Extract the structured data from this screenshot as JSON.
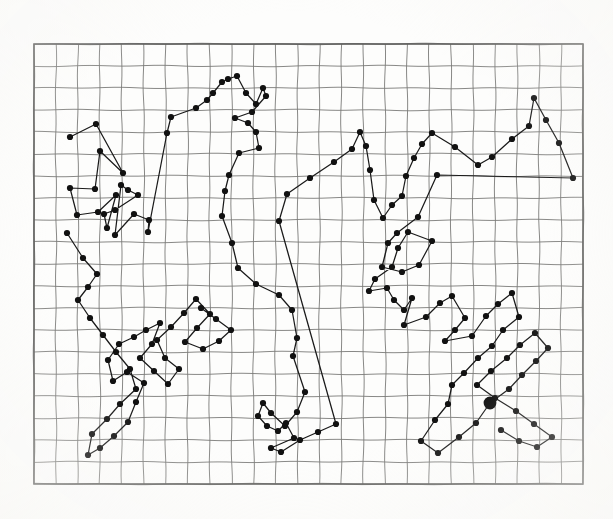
{
  "figure": {
    "kind": "scatter-path-plot-on-graph-paper",
    "image_size": {
      "width": 613,
      "height": 519
    },
    "background_color": "#fdfdfc",
    "grid": {
      "visible": true,
      "x0": 34,
      "y0": 44,
      "x1": 583,
      "y1": 484,
      "columns": 25,
      "rows": 20,
      "cell_width": 21.96,
      "cell_height": 22.0,
      "line_color": "#7a7a78",
      "line_width": 0.9,
      "border_color": "#5d5d5b",
      "border_width": 1.6
    },
    "path": {
      "stroke_color": "#1a1a1a",
      "stroke_width": 1.25,
      "marker_shape": "filled-circle",
      "marker_color": "#111111",
      "marker_radius": 3.1
    },
    "highlight_marker": {
      "label": "depot",
      "x": 490,
      "y": 403,
      "radius": 6.4,
      "color": "#0d0d0d"
    }
  },
  "chart_data": {
    "type": "scatter",
    "title": "",
    "subtitle": "",
    "xlabel": "",
    "ylabel": "",
    "xlim": [
      34,
      583
    ],
    "ylim": [
      44,
      484
    ],
    "grid": true,
    "legend": "none",
    "annotations": [],
    "series": [
      {
        "name": "tour",
        "kind": "path",
        "closed": false,
        "points": [
          [
            70,
            137
          ],
          [
            96,
            124
          ],
          [
            123,
            173
          ],
          [
            100,
            151
          ],
          [
            95,
            189
          ],
          [
            70,
            188
          ],
          [
            77,
            215
          ],
          [
            98,
            212
          ],
          [
            116,
            195
          ],
          [
            107,
            228
          ],
          [
            104,
            214
          ],
          [
            115,
            210
          ],
          [
            138,
            195
          ],
          [
            128,
            190
          ],
          [
            121,
            185
          ],
          [
            115,
            235
          ],
          [
            134,
            214
          ],
          [
            149,
            220
          ],
          [
            148,
            232
          ],
          [
            167,
            133
          ],
          [
            171,
            117
          ],
          [
            196,
            108
          ],
          [
            207,
            100
          ],
          [
            213,
            93
          ],
          [
            222,
            82
          ],
          [
            228,
            79
          ],
          [
            237,
            76
          ],
          [
            246,
            93
          ],
          [
            256,
            104
          ],
          [
            263,
            88
          ],
          [
            266,
            96
          ],
          [
            252,
            112
          ],
          [
            235,
            118
          ],
          [
            248,
            123
          ],
          [
            256,
            132
          ],
          [
            259,
            148
          ],
          [
            239,
            153
          ],
          [
            229,
            175
          ],
          [
            225,
            191
          ],
          [
            222,
            216
          ],
          [
            232,
            243
          ],
          [
            238,
            268
          ],
          [
            256,
            284
          ],
          [
            279,
            295
          ],
          [
            292,
            310
          ],
          [
            297,
            338
          ],
          [
            293,
            356
          ],
          [
            305,
            392
          ],
          [
            297,
            412
          ],
          [
            285,
            426
          ],
          [
            271,
            413
          ],
          [
            263,
            403
          ],
          [
            258,
            416
          ],
          [
            267,
            426
          ],
          [
            278,
            431
          ],
          [
            286,
            423
          ],
          [
            294,
            438
          ],
          [
            271,
            448
          ],
          [
            281,
            452
          ],
          [
            300,
            440
          ],
          [
            318,
            432
          ],
          [
            336,
            424
          ],
          [
            279,
            221
          ],
          [
            287,
            194
          ],
          [
            310,
            178
          ],
          [
            334,
            162
          ],
          [
            352,
            149
          ],
          [
            360,
            132
          ],
          [
            366,
            146
          ],
          [
            370,
            170
          ],
          [
            374,
            200
          ],
          [
            383,
            218
          ],
          [
            392,
            205
          ],
          [
            402,
            196
          ],
          [
            406,
            176
          ],
          [
            414,
            158
          ],
          [
            422,
            144
          ],
          [
            432,
            133
          ],
          [
            455,
            147
          ],
          [
            478,
            165
          ],
          [
            492,
            157
          ],
          [
            512,
            139
          ],
          [
            529,
            126
          ],
          [
            534,
            98
          ],
          [
            546,
            120
          ],
          [
            559,
            143
          ],
          [
            573,
            178
          ],
          [
            437,
            175
          ],
          [
            418,
            217
          ],
          [
            397,
            233
          ],
          [
            388,
            243
          ],
          [
            382,
            267
          ],
          [
            402,
            272
          ],
          [
            419,
            265
          ],
          [
            432,
            241
          ],
          [
            408,
            232
          ],
          [
            398,
            248
          ],
          [
            392,
            267
          ],
          [
            375,
            279
          ],
          [
            369,
            291
          ],
          [
            387,
            288
          ],
          [
            394,
            300
          ],
          [
            404,
            310
          ],
          [
            412,
            298
          ],
          [
            404,
            325
          ],
          [
            426,
            317
          ],
          [
            440,
            303
          ],
          [
            452,
            296
          ],
          [
            465,
            318
          ],
          [
            455,
            330
          ],
          [
            445,
            341
          ],
          [
            472,
            336
          ],
          [
            486,
            316
          ],
          [
            498,
            304
          ],
          [
            512,
            293
          ],
          [
            519,
            317
          ],
          [
            503,
            330
          ],
          [
            492,
            346
          ],
          [
            478,
            358
          ],
          [
            464,
            373
          ],
          [
            452,
            385
          ],
          [
            448,
            404
          ],
          [
            435,
            420
          ],
          [
            421,
            441
          ],
          [
            438,
            453
          ],
          [
            459,
            437
          ],
          [
            476,
            423
          ],
          [
            490,
            403
          ],
          [
            509,
            389
          ],
          [
            522,
            375
          ],
          [
            536,
            361
          ],
          [
            548,
            348
          ],
          [
            535,
            333
          ],
          [
            520,
            345
          ],
          [
            507,
            358
          ],
          [
            491,
            371
          ],
          [
            477,
            385
          ],
          [
            495,
            398
          ],
          [
            516,
            411
          ],
          [
            534,
            424
          ],
          [
            552,
            437
          ],
          [
            537,
            447
          ],
          [
            519,
            441
          ],
          [
            501,
            430
          ]
        ]
      },
      {
        "name": "cluster-upper-left-detail",
        "kind": "path",
        "closed": false,
        "points": [
          [
            67,
            233
          ],
          [
            83,
            258
          ],
          [
            97,
            274
          ],
          [
            88,
            287
          ],
          [
            78,
            300
          ],
          [
            90,
            318
          ],
          [
            103,
            335
          ],
          [
            116,
            352
          ],
          [
            130,
            369
          ],
          [
            136,
            389
          ],
          [
            120,
            404
          ],
          [
            107,
            419
          ],
          [
            92,
            434
          ],
          [
            88,
            455
          ],
          [
            100,
            448
          ],
          [
            114,
            436
          ],
          [
            128,
            422
          ],
          [
            136,
            402
          ],
          [
            144,
            383
          ],
          [
            127,
            372
          ],
          [
            113,
            381
          ],
          [
            108,
            360
          ],
          [
            119,
            344
          ],
          [
            134,
            337
          ],
          [
            146,
            330
          ],
          [
            160,
            323
          ],
          [
            152,
            344
          ],
          [
            140,
            358
          ],
          [
            154,
            371
          ],
          [
            168,
            384
          ],
          [
            179,
            369
          ],
          [
            165,
            358
          ],
          [
            157,
            340
          ],
          [
            171,
            327
          ],
          [
            184,
            313
          ],
          [
            196,
            299
          ],
          [
            210,
            314
          ],
          [
            197,
            328
          ],
          [
            185,
            342
          ],
          [
            203,
            349
          ],
          [
            219,
            341
          ],
          [
            231,
            330
          ],
          [
            216,
            319
          ],
          [
            201,
            308
          ]
        ]
      }
    ]
  }
}
